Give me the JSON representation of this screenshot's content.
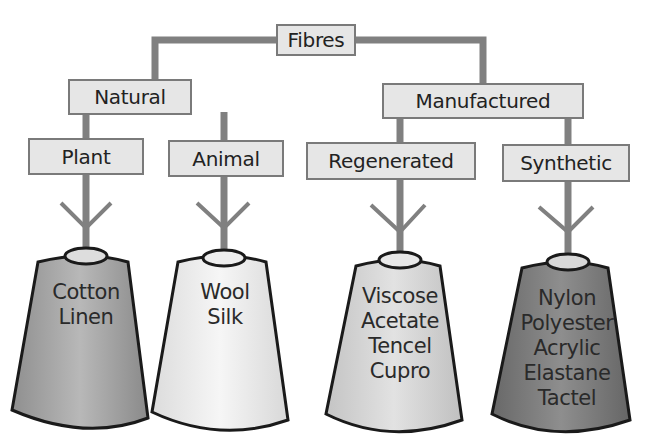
{
  "diagram": {
    "root": {
      "label": "Fibres"
    },
    "categories": [
      {
        "label": "Natural"
      },
      {
        "label": "Manufactured"
      }
    ],
    "subcategories": [
      {
        "label": "Plant",
        "parent": "Natural"
      },
      {
        "label": "Animal",
        "parent": "Natural"
      },
      {
        "label": "Regenerated",
        "parent": "Manufactured"
      },
      {
        "label": "Synthetic",
        "parent": "Manufactured"
      }
    ],
    "spools": [
      {
        "category": "Plant",
        "fibres": [
          "Cotton",
          "Linen"
        ],
        "color": "#a9a9a9"
      },
      {
        "category": "Animal",
        "fibres": [
          "Wool",
          "Silk"
        ],
        "color": "#eeeeee"
      },
      {
        "category": "Regenerated",
        "fibres": [
          "Viscose",
          "Acetate",
          "Tencel",
          "Cupro"
        ],
        "color": "#d4d4d4"
      },
      {
        "category": "Synthetic",
        "fibres": [
          "Nylon",
          "Polyester",
          "Acrylic",
          "Elastane",
          "Tactel"
        ],
        "color": "#7d7d7d"
      }
    ],
    "colors": {
      "box_fill": "#e6e6e6",
      "box_border": "#7a7a7a",
      "connector": "#808080"
    }
  }
}
